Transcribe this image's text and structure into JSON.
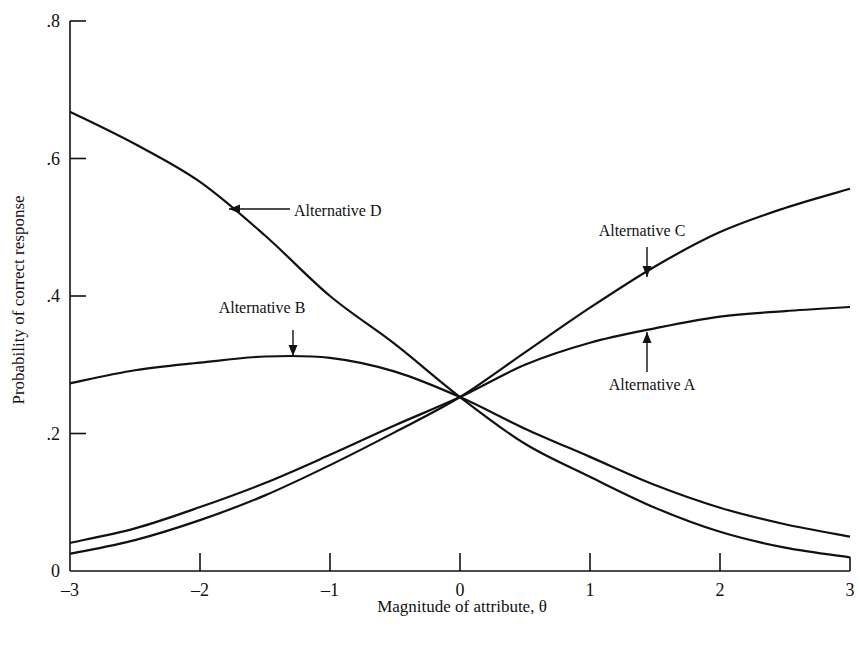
{
  "chart_data": {
    "type": "line",
    "title": "",
    "xlabel": "Magnitude of attribute, θ",
    "ylabel": "Probability of correct response",
    "xlim": [
      -3,
      3
    ],
    "ylim": [
      0,
      0.8
    ],
    "grid": false,
    "legend": "inline annotations with arrows",
    "x_ticks": [
      {
        "value": -3,
        "label": "–3"
      },
      {
        "value": -2,
        "label": "–2"
      },
      {
        "value": -1,
        "label": "–1"
      },
      {
        "value": 0,
        "label": "0"
      },
      {
        "value": 1,
        "label": "1"
      },
      {
        "value": 2,
        "label": "2"
      },
      {
        "value": 3,
        "label": "3"
      }
    ],
    "y_ticks": [
      {
        "value": 0,
        "label": "0"
      },
      {
        "value": 0.2,
        "label": ".2"
      },
      {
        "value": 0.4,
        "label": ".4"
      },
      {
        "value": 0.6,
        "label": ".6"
      },
      {
        "value": 0.8,
        "label": ".8"
      }
    ],
    "x": [
      -3,
      -2.5,
      -2,
      -1.5,
      -1,
      -0.5,
      0,
      0.5,
      1,
      1.5,
      2,
      2.5,
      3
    ],
    "series": [
      {
        "name": "Alternative A",
        "values": [
          0.041,
          0.062,
          0.093,
          0.128,
          0.169,
          0.212,
          0.253,
          0.3,
          0.332,
          0.353,
          0.37,
          0.378,
          0.384
        ]
      },
      {
        "name": "Alternative B",
        "values": [
          0.273,
          0.292,
          0.303,
          0.312,
          0.31,
          0.29,
          0.253,
          0.207,
          0.166,
          0.125,
          0.092,
          0.068,
          0.05
        ]
      },
      {
        "name": "Alternative C",
        "values": [
          0.025,
          0.045,
          0.074,
          0.11,
          0.154,
          0.202,
          0.253,
          0.318,
          0.383,
          0.443,
          0.493,
          0.528,
          0.556
        ]
      },
      {
        "name": "Alternative D",
        "values": [
          0.668,
          0.621,
          0.566,
          0.488,
          0.4,
          0.33,
          0.253,
          0.185,
          0.137,
          0.092,
          0.057,
          0.034,
          0.02
        ]
      }
    ],
    "annotations": [
      {
        "text": "Alternative D",
        "arrow": "left",
        "target_x": -1.8,
        "target_y": 0.53
      },
      {
        "text": "Alternative B",
        "arrow": "down",
        "target_x": -1.3,
        "target_y": 0.31
      },
      {
        "text": "Alternative C",
        "arrow": "down",
        "target_x": 1.4,
        "target_y": 0.43
      },
      {
        "text": "Alternative A",
        "arrow": "up",
        "target_x": 1.4,
        "target_y": 0.35
      }
    ]
  },
  "labels": {
    "alt_a": "Alternative A",
    "alt_b": "Alternative B",
    "alt_c": "Alternative C",
    "alt_d": "Alternative D",
    "xlabel": "Magnitude of attribute, θ",
    "ylabel": "Probability of correct response"
  }
}
